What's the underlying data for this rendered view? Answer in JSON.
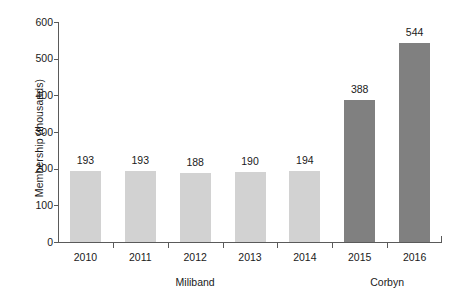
{
  "chart_data": {
    "type": "bar",
    "title": "",
    "subtitle": "",
    "xlabel": "",
    "ylabel": "Membership (thousands)",
    "categories": [
      "2010",
      "2011",
      "2012",
      "2013",
      "2014",
      "2015",
      "2016"
    ],
    "values": [
      193,
      193,
      188,
      190,
      194,
      388,
      544
    ],
    "bar_labels": [
      "193",
      "193",
      "188",
      "190",
      "194",
      "388",
      "544"
    ],
    "bar_colors": [
      "#d2d2d2",
      "#d2d2d2",
      "#d2d2d2",
      "#d2d2d2",
      "#d2d2d2",
      "#808080",
      "#808080"
    ],
    "ylim": [
      0,
      600
    ],
    "y_ticks": [
      0,
      100,
      200,
      300,
      400,
      500,
      600
    ],
    "y_tick_labels": [
      "0",
      "100",
      "200",
      "300",
      "400",
      "500",
      "600"
    ],
    "grid": false,
    "legend": false,
    "legend_position": "none",
    "groups": [
      {
        "label": "Miliband",
        "categories": [
          "2010",
          "2011",
          "2012",
          "2013",
          "2014"
        ],
        "color": "#d2d2d2"
      },
      {
        "label": "Corbyn",
        "categories": [
          "2015",
          "2016"
        ],
        "color": "#808080"
      }
    ],
    "axis_color": "#5a5a5a",
    "background_color": "#ffffff",
    "text_color": "#1a1a1a"
  }
}
